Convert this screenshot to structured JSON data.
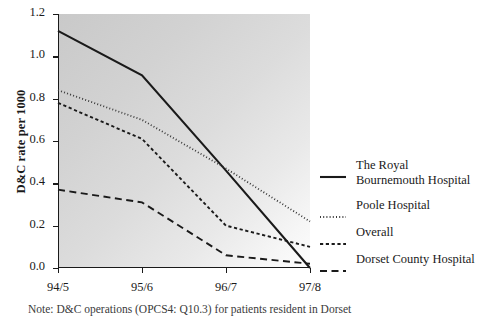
{
  "chart_data": {
    "type": "line",
    "title": "",
    "xlabel": "",
    "ylabel": "D&C rate per 1000",
    "categories": [
      "94/5",
      "95/6",
      "96/7",
      "97/8"
    ],
    "ylim": [
      0.0,
      1.2
    ],
    "ytick_labels": [
      "0.0",
      "0.2",
      "0.4",
      "0.6",
      "0.8",
      "1.0",
      "1.2"
    ],
    "ytick_values": [
      0.0,
      0.2,
      0.4,
      0.6,
      0.8,
      1.0,
      1.2
    ],
    "grid": false,
    "legend_position": "right",
    "series": [
      {
        "name": "The Royal Bournemouth Hospital",
        "style": "solid",
        "color": "#1a1a1a",
        "values": [
          1.12,
          0.91,
          0.46,
          0.0
        ]
      },
      {
        "name": "Poole Hospital",
        "style": "dotted",
        "color": "#3a3a3a",
        "values": [
          0.84,
          0.7,
          0.47,
          0.22
        ]
      },
      {
        "name": "Overall",
        "style": "dashed-short",
        "color": "#1a1a1a",
        "values": [
          0.78,
          0.61,
          0.2,
          0.1
        ]
      },
      {
        "name": "Dorset County Hospital",
        "style": "dashed-long",
        "color": "#1a1a1a",
        "values": [
          0.37,
          0.31,
          0.06,
          0.02
        ]
      }
    ]
  },
  "legend": {
    "items": [
      {
        "label": "The Royal Bournemouth Hospital"
      },
      {
        "label": "Poole Hospital"
      },
      {
        "label": "Overall"
      },
      {
        "label": "Dorset County Hospital"
      }
    ]
  },
  "footnote": {
    "text": "Note: D&C operations (OPCS4: Q10.3) for patients resident in Dorset"
  }
}
